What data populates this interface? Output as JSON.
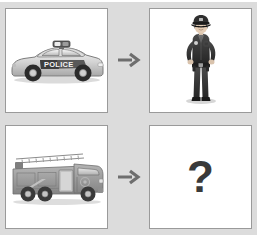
{
  "puzzle": {
    "title": "Visual Analogy Puzzle",
    "type": "analogy-grid",
    "rows": 2,
    "columns": 2,
    "background_color": "#dcdcdc",
    "cell_background_color": "#ffffff",
    "cell_border_color": "#9a9a9a",
    "arrow_color": "#6e6e6e",
    "question_mark_color": "#3a3a3a"
  },
  "cells": {
    "row1": {
      "prompt": {
        "icon": "police-car-icon",
        "label": "Police car",
        "vehicle_text": "POLICE",
        "palette": "grayscale"
      },
      "arrow": {
        "icon": "arrow-right-icon",
        "label": "leads to"
      },
      "answer": {
        "icon": "police-officer-icon",
        "label": "Police officer",
        "palette": "grayscale"
      }
    },
    "row2": {
      "prompt": {
        "icon": "fire-truck-icon",
        "label": "Fire truck",
        "palette": "grayscale"
      },
      "arrow": {
        "icon": "arrow-right-icon",
        "label": "leads to"
      },
      "answer": {
        "icon": "question-mark-icon",
        "label": "?",
        "text": "?"
      }
    }
  }
}
